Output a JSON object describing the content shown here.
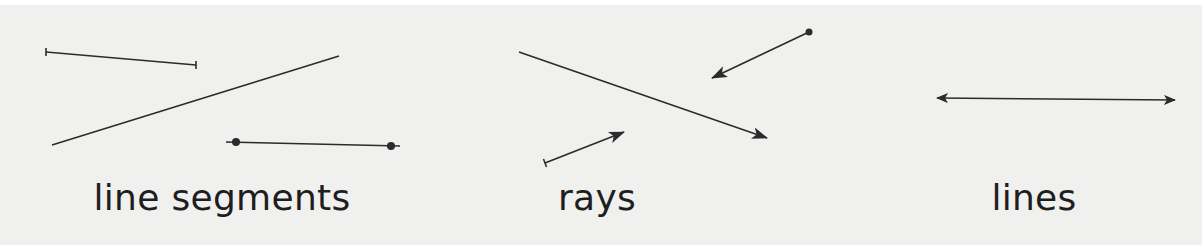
{
  "diagram": {
    "title": "",
    "colors": {
      "background": "#f0f0ef",
      "stroke": "#2b2b2b",
      "text": "#1e1e1e"
    },
    "groups": [
      {
        "label": "line segments",
        "items": [
          {
            "type": "segment",
            "endpoints": "tick-marks",
            "from": [
              46,
              52
            ],
            "to": [
              196,
              65
            ]
          },
          {
            "type": "segment",
            "endpoints": "none",
            "from": [
              52,
              145
            ],
            "to": [
              339,
              56
            ]
          },
          {
            "type": "segment",
            "endpoints": "dots",
            "from": [
              236,
              142
            ],
            "to": [
              391,
              146
            ]
          }
        ]
      },
      {
        "label": "rays",
        "items": [
          {
            "type": "ray",
            "origin": "none",
            "from": [
              519,
              52
            ],
            "arrow_to": [
              767,
              138
            ]
          },
          {
            "type": "ray",
            "origin": "dot",
            "from": [
              809,
              32
            ],
            "arrow_to": [
              712,
              78
            ]
          },
          {
            "type": "ray",
            "origin": "tick-mark",
            "from": [
              545,
              163
            ],
            "arrow_to": [
              624,
              132
            ]
          }
        ]
      },
      {
        "label": "lines",
        "items": [
          {
            "type": "line",
            "arrows": "both",
            "from": [
              937,
              98
            ],
            "to": [
              1175,
              100
            ]
          }
        ]
      }
    ]
  }
}
